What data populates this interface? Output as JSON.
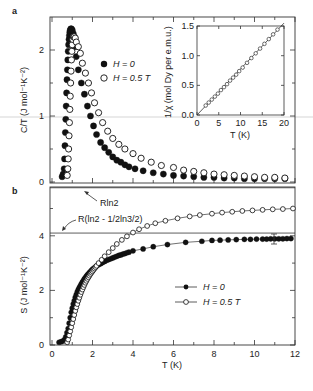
{
  "figure": {
    "panel_a_label": "a",
    "panel_b_label": "b"
  },
  "chart_data": [
    {
      "type": "scatter",
      "panel": "a",
      "ylabel": "C/T (J mol⁻¹K⁻²)",
      "xlabel": "",
      "xlim": [
        0,
        12
      ],
      "ylim": [
        0,
        2.4
      ],
      "yticks": [
        "0",
        "1",
        "2"
      ],
      "legend": [
        {
          "marker": "filled-circle",
          "label": "H = 0"
        },
        {
          "marker": "open-circle",
          "label": "H = 0.5 T"
        }
      ],
      "series": [
        {
          "name": "H = 0",
          "marker": "filled",
          "x": [
            0.5,
            0.55,
            0.6,
            0.62,
            0.64,
            0.66,
            0.68,
            0.7,
            0.72,
            0.74,
            0.76,
            0.78,
            0.8,
            0.82,
            0.84,
            0.86,
            0.88,
            0.9,
            0.93,
            0.96,
            1.0,
            1.05,
            1.1,
            1.15,
            1.2,
            1.3,
            1.45,
            1.6,
            1.75,
            1.9,
            2.05,
            2.2,
            2.4,
            2.6,
            2.8,
            3.0,
            3.2,
            3.4,
            3.6,
            3.8,
            4.1,
            4.5,
            5.0,
            5.5,
            6.0,
            6.5,
            7.0,
            7.5,
            8.0,
            8.5,
            9.0,
            9.5,
            10.0,
            10.5,
            11.0,
            11.5
          ],
          "y": [
            0.08,
            0.12,
            0.2,
            0.35,
            0.55,
            0.75,
            0.95,
            1.15,
            1.35,
            1.55,
            1.7,
            1.85,
            1.98,
            2.08,
            2.16,
            2.22,
            2.27,
            2.3,
            2.32,
            2.32,
            2.3,
            2.25,
            2.18,
            2.05,
            1.9,
            1.7,
            1.5,
            1.33,
            1.15,
            1.0,
            0.85,
            0.72,
            0.6,
            0.52,
            0.45,
            0.38,
            0.33,
            0.3,
            0.26,
            0.23,
            0.2,
            0.17,
            0.14,
            0.12,
            0.1,
            0.09,
            0.08,
            0.07,
            0.07,
            0.06,
            0.06,
            0.05,
            0.05,
            0.05,
            0.05,
            0.05
          ]
        },
        {
          "name": "H = 0.5 T",
          "marker": "open",
          "x": [
            0.75,
            0.78,
            0.8,
            0.82,
            0.84,
            0.86,
            0.88,
            0.9,
            0.92,
            0.94,
            0.96,
            0.98,
            1.0,
            1.03,
            1.06,
            1.1,
            1.15,
            1.2,
            1.3,
            1.4,
            1.5,
            1.65,
            1.8,
            1.95,
            2.1,
            2.3,
            2.5,
            2.75,
            3.0,
            3.3,
            3.6,
            4.0,
            4.4,
            4.9,
            5.4,
            6.0,
            6.5,
            7.0,
            7.5,
            8.0,
            8.5,
            9.0,
            9.5,
            10.0,
            10.5,
            11.0,
            11.5
          ],
          "y": [
            0.1,
            0.2,
            0.35,
            0.5,
            0.7,
            0.9,
            1.1,
            1.3,
            1.5,
            1.68,
            1.85,
            1.98,
            2.08,
            2.16,
            2.2,
            2.2,
            2.18,
            2.12,
            2.05,
            1.95,
            1.8,
            1.65,
            1.5,
            1.35,
            1.2,
            1.05,
            0.9,
            0.77,
            0.66,
            0.57,
            0.5,
            0.43,
            0.36,
            0.3,
            0.25,
            0.22,
            0.18,
            0.16,
            0.14,
            0.12,
            0.11,
            0.1,
            0.09,
            0.08,
            0.07,
            0.07,
            0.06
          ]
        }
      ]
    },
    {
      "type": "scatter",
      "panel": "a-inset",
      "xlabel": "T (K)",
      "ylabel": "1/χ (mol Dy per e.m.u.)",
      "xlim": [
        0,
        20
      ],
      "ylim": [
        0,
        1.5
      ],
      "xticks": [
        "0",
        "5",
        "10",
        "15",
        "20"
      ],
      "yticks": [
        "0.0",
        "0.5",
        "1.0",
        "1.5"
      ],
      "fit_line": {
        "x": [
          0,
          20
        ],
        "y": [
          0.0,
          1.55
        ]
      },
      "series": [
        {
          "name": "1/chi",
          "marker": "open",
          "x": [
            2,
            2.7,
            3.4,
            4.1,
            4.8,
            5.5,
            6.2,
            6.9,
            7.6,
            8.3,
            9.0,
            9.7,
            10.5,
            11.5,
            12.5,
            13.5,
            14.5,
            15.5,
            16.5,
            17.5,
            18.5
          ],
          "y": [
            0.16,
            0.21,
            0.26,
            0.31,
            0.36,
            0.42,
            0.47,
            0.52,
            0.58,
            0.63,
            0.68,
            0.74,
            0.8,
            0.88,
            0.96,
            1.04,
            1.12,
            1.2,
            1.28,
            1.36,
            1.44
          ]
        }
      ]
    },
    {
      "type": "line",
      "panel": "b",
      "xlabel": "T (K)",
      "ylabel": "S (J mol⁻¹K⁻²)",
      "xlim": [
        0,
        12
      ],
      "ylim": [
        0,
        5.8
      ],
      "xticks": [
        "0",
        "2",
        "4",
        "6",
        "8",
        "10",
        "12"
      ],
      "yticks": [
        "0",
        "2",
        "4"
      ],
      "reference_lines": [
        {
          "label": "Rln2",
          "value": 5.76
        },
        {
          "label": "R(ln2 - 1/2ln3/2)",
          "value": 4.1
        }
      ],
      "legend": [
        {
          "marker": "filled-circle-line",
          "label": "H = 0"
        },
        {
          "marker": "open-circle-line",
          "label": "H = 0.5 T"
        }
      ],
      "series": [
        {
          "name": "H = 0",
          "marker": "filled",
          "x": [
            0.35,
            0.45,
            0.55,
            0.62,
            0.68,
            0.74,
            0.8,
            0.85,
            0.9,
            0.95,
            1.0,
            1.05,
            1.1,
            1.15,
            1.2,
            1.25,
            1.3,
            1.35,
            1.4,
            1.45,
            1.5,
            1.55,
            1.6,
            1.65,
            1.7,
            1.75,
            1.8,
            1.85,
            1.9,
            1.95,
            2.0,
            2.05,
            2.1,
            2.15,
            2.2,
            2.3,
            2.4,
            2.5,
            2.6,
            2.7,
            2.8,
            2.9,
            3.0,
            3.1,
            3.2,
            3.3,
            3.4,
            3.5,
            3.6,
            3.7,
            3.8,
            4.0,
            4.5,
            5.0,
            5.7,
            6.6,
            7.4,
            7.9,
            8.3,
            8.7,
            9.1,
            9.5,
            9.8,
            10.1,
            10.4,
            10.6,
            10.8,
            11.0,
            11.2,
            11.4,
            11.6,
            11.8
          ],
          "y": [
            0.1,
            0.12,
            0.15,
            0.2,
            0.3,
            0.45,
            0.6,
            0.8,
            1.0,
            1.2,
            1.35,
            1.5,
            1.62,
            1.75,
            1.85,
            1.95,
            2.03,
            2.1,
            2.17,
            2.24,
            2.3,
            2.36,
            2.42,
            2.47,
            2.52,
            2.57,
            2.61,
            2.65,
            2.69,
            2.73,
            2.77,
            2.8,
            2.83,
            2.86,
            2.89,
            2.94,
            2.98,
            3.02,
            3.06,
            3.1,
            3.13,
            3.16,
            3.19,
            3.22,
            3.25,
            3.28,
            3.3,
            3.33,
            3.35,
            3.38,
            3.4,
            3.45,
            3.52,
            3.6,
            3.68,
            3.76,
            3.8,
            3.83,
            3.84,
            3.85,
            3.86,
            3.87,
            3.87,
            3.88,
            3.88,
            3.88,
            3.89,
            3.89,
            3.89,
            3.89,
            3.9,
            3.9
          ]
        },
        {
          "name": "H = 0.5 T",
          "marker": "open",
          "x": [
            0.75,
            0.8,
            0.85,
            0.9,
            0.95,
            1.0,
            1.05,
            1.1,
            1.15,
            1.2,
            1.25,
            1.3,
            1.35,
            1.4,
            1.45,
            1.5,
            1.55,
            1.6,
            1.65,
            1.7,
            1.75,
            1.8,
            1.85,
            1.9,
            1.95,
            2.0,
            2.05,
            2.1,
            2.15,
            2.2,
            2.3,
            2.45,
            2.6,
            2.8,
            3.0,
            3.2,
            3.45,
            3.7,
            4.0,
            4.3,
            4.7,
            5.1,
            5.6,
            6.2,
            6.8,
            7.3,
            7.9,
            8.4,
            8.9,
            9.4,
            9.9,
            10.4,
            10.9,
            11.4,
            11.9
          ],
          "y": [
            0.1,
            0.2,
            0.35,
            0.5,
            0.65,
            0.8,
            0.95,
            1.1,
            1.25,
            1.38,
            1.5,
            1.62,
            1.73,
            1.84,
            1.94,
            2.03,
            2.12,
            2.2,
            2.28,
            2.35,
            2.42,
            2.48,
            2.54,
            2.6,
            2.65,
            2.7,
            2.75,
            2.8,
            2.85,
            2.9,
            3.0,
            3.12,
            3.25,
            3.4,
            3.55,
            3.7,
            3.85,
            3.98,
            4.12,
            4.24,
            4.36,
            4.46,
            4.55,
            4.64,
            4.71,
            4.76,
            4.81,
            4.85,
            4.88,
            4.91,
            4.93,
            4.95,
            4.97,
            4.98,
            5.0
          ]
        }
      ]
    }
  ]
}
